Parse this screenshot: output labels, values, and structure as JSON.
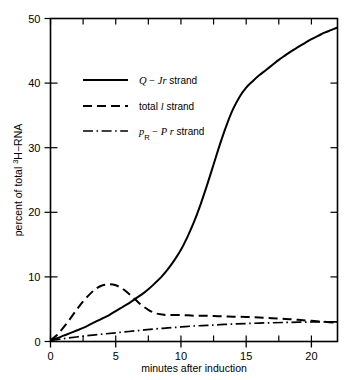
{
  "chart_data": {
    "type": "line",
    "title": "",
    "xlabel": "minutes after induction",
    "ylabel": "percent of total ³H−RNA",
    "xlim": [
      0,
      22
    ],
    "ylim": [
      0,
      50
    ],
    "xticks": [
      0,
      5,
      10,
      15,
      20
    ],
    "xticklabels": [
      "0",
      "5",
      "10",
      "15",
      "20"
    ],
    "xminor_step": 2.5,
    "yticks": [
      0,
      10,
      20,
      30,
      40,
      50
    ],
    "yticklabels": [
      "0",
      "10",
      "20",
      "30",
      "40",
      "50"
    ],
    "grid": false,
    "frame": "box",
    "legend_position": "upper-left-inside",
    "series": [
      {
        "name": "Q − J r strand",
        "label_parts": {
          "sym1": "Q",
          "dash": "−",
          "sym2": "J",
          "sym3": "r",
          "word": "strand"
        },
        "style": "solid",
        "x": [
          0,
          0.5,
          1,
          1.5,
          2,
          2.5,
          3,
          3.5,
          4,
          4.5,
          5,
          5.5,
          6,
          6.5,
          7,
          7.5,
          8,
          8.5,
          9,
          9.5,
          10,
          10.5,
          11,
          11.5,
          12,
          12.5,
          13,
          13.5,
          14,
          14.5,
          15,
          15.5,
          16,
          16.5,
          17,
          17.5,
          18,
          18.5,
          19,
          19.5,
          20,
          20.5,
          21,
          21.5,
          22
        ],
        "y": [
          0.2,
          0.5,
          0.9,
          1.3,
          1.7,
          2.1,
          2.6,
          3.1,
          3.6,
          4.1,
          4.7,
          5.3,
          5.9,
          6.6,
          7.3,
          8.1,
          9.0,
          10.0,
          11.2,
          12.6,
          14.2,
          16.2,
          18.5,
          21.2,
          24.2,
          27.4,
          30.6,
          33.5,
          36.0,
          37.9,
          39.3,
          40.3,
          41.2,
          42.0,
          42.8,
          43.6,
          44.3,
          45.0,
          45.6,
          46.2,
          46.8,
          47.3,
          47.8,
          48.2,
          48.6
        ]
      },
      {
        "name": "total l strand",
        "label_parts": {
          "sym1": "total",
          "sym2": "l",
          "word": "strand"
        },
        "style": "dashed",
        "x": [
          0,
          0.5,
          1,
          1.5,
          2,
          2.5,
          3,
          3.5,
          4,
          4.5,
          5,
          5.5,
          6,
          6.5,
          7,
          7.5,
          8,
          8.5,
          9,
          10,
          11,
          12,
          13,
          14,
          15,
          16,
          17,
          18,
          19,
          20,
          21,
          22
        ],
        "y": [
          0.2,
          1.0,
          2.2,
          3.5,
          4.9,
          6.2,
          7.3,
          8.2,
          8.7,
          8.85,
          8.7,
          8.2,
          7.4,
          6.5,
          5.6,
          4.9,
          4.4,
          4.2,
          4.1,
          4.1,
          4.0,
          4.0,
          3.9,
          3.85,
          3.8,
          3.7,
          3.6,
          3.5,
          3.35,
          3.2,
          3.05,
          2.9
        ]
      },
      {
        "name": "pR − P r strand",
        "label_parts": {
          "sym1": "p",
          "sub": "R",
          "dash": "−",
          "sym2": "P",
          "sym3": "r",
          "word": "strand"
        },
        "style": "dashdot",
        "x": [
          0,
          1,
          2,
          3,
          4,
          5,
          6,
          7,
          8,
          9,
          10,
          11,
          12,
          13,
          14,
          15,
          16,
          17,
          18,
          19,
          20,
          21,
          22
        ],
        "y": [
          0.15,
          0.45,
          0.7,
          0.95,
          1.15,
          1.35,
          1.55,
          1.75,
          1.95,
          2.1,
          2.25,
          2.4,
          2.5,
          2.6,
          2.7,
          2.78,
          2.85,
          2.9,
          2.95,
          3.0,
          3.02,
          3.05,
          3.05
        ]
      }
    ]
  },
  "legend": {
    "entries": [
      {
        "swatch": "solid-line-swatch",
        "text": "Q − J r strand"
      },
      {
        "swatch": "dashed-line-swatch",
        "text": "total l strand"
      },
      {
        "swatch": "dashdot-line-swatch",
        "text": "pʀ − P r strand"
      }
    ]
  }
}
